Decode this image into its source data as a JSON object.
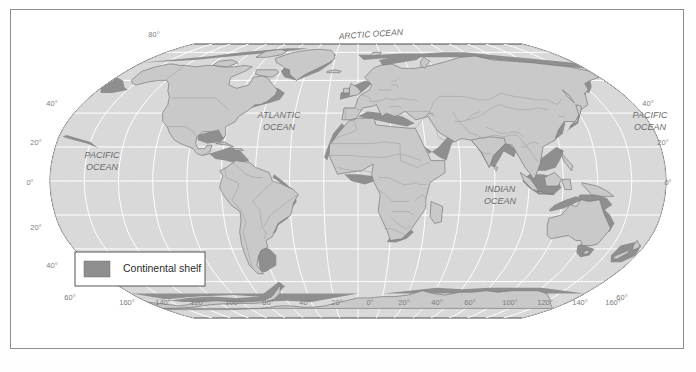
{
  "figure": {
    "type": "map",
    "projection": "Robinson",
    "background_color": "#ffffff",
    "frame_color": "#8d8d8d"
  },
  "colors": {
    "ocean": "#d9d9d9",
    "land": "#c9c9c9",
    "shelf": "#8f8f8f",
    "graticule": "#ffffff",
    "coast_outline": "#7a7a7a",
    "country_border": "#9a9a9a",
    "map_edge": "#4a4a4a",
    "label_text": "#6b6b6b",
    "legend_text": "#2b2b2b",
    "legend_border": "#555555",
    "legend_fill": "#ffffff"
  },
  "ocean_labels": [
    {
      "id": "arctic-ocean",
      "text": "ARCTIC  OCEAN",
      "x": 371,
      "y": 37,
      "size": 8.5,
      "rotate": -4
    },
    {
      "id": "atlantic-ocean-line1",
      "text": "ATLANTIC",
      "x": 279,
      "y": 118,
      "size": 9
    },
    {
      "id": "atlantic-ocean-line2",
      "text": "OCEAN",
      "x": 279,
      "y": 130,
      "size": 9
    },
    {
      "id": "pacific-ocean-west-line1",
      "text": "PACIFIC",
      "x": 102,
      "y": 158,
      "size": 9
    },
    {
      "id": "pacific-ocean-west-line2",
      "text": "OCEAN",
      "x": 102,
      "y": 170,
      "size": 9
    },
    {
      "id": "pacific-ocean-east-line1",
      "text": "PACIFIC",
      "x": 650,
      "y": 118,
      "size": 9
    },
    {
      "id": "pacific-ocean-east-line2",
      "text": "OCEAN",
      "x": 650,
      "y": 130,
      "size": 9
    },
    {
      "id": "indian-ocean-line1",
      "text": "INDIAN",
      "x": 500,
      "y": 192,
      "size": 9
    },
    {
      "id": "indian-ocean-line2",
      "text": "OCEAN",
      "x": 500,
      "y": 204,
      "size": 9
    }
  ],
  "latitude_labels_left": [
    {
      "text": "80°",
      "x": 154,
      "y": 37
    },
    {
      "text": "40°",
      "x": 52,
      "y": 106
    },
    {
      "text": "20°",
      "x": 36,
      "y": 145
    },
    {
      "text": "0°",
      "x": 30,
      "y": 185
    },
    {
      "text": "20°",
      "x": 36,
      "y": 230
    },
    {
      "text": "40°",
      "x": 52,
      "y": 268
    },
    {
      "text": "60°",
      "x": 70,
      "y": 300
    }
  ],
  "latitude_labels_right": [
    {
      "text": "40°",
      "x": 648,
      "y": 106
    },
    {
      "text": "20°",
      "x": 663,
      "y": 145
    },
    {
      "text": "0°",
      "x": 668,
      "y": 185
    },
    {
      "text": "60°",
      "x": 622,
      "y": 300
    }
  ],
  "longitude_labels": [
    {
      "text": "160°",
      "x": 127,
      "y": 305
    },
    {
      "text": "140°",
      "x": 163,
      "y": 305
    },
    {
      "text": "120°",
      "x": 198,
      "y": 305
    },
    {
      "text": "100°",
      "x": 233,
      "y": 305
    },
    {
      "text": "80°",
      "x": 268,
      "y": 305
    },
    {
      "text": "40°",
      "x": 305,
      "y": 305
    },
    {
      "text": "20°",
      "x": 337,
      "y": 305
    },
    {
      "text": "0°",
      "x": 370,
      "y": 305
    },
    {
      "text": "20°",
      "x": 404,
      "y": 305
    },
    {
      "text": "40°",
      "x": 437,
      "y": 305
    },
    {
      "text": "60°",
      "x": 470,
      "y": 305
    },
    {
      "text": "100°",
      "x": 510,
      "y": 305
    },
    {
      "text": "120°",
      "x": 545,
      "y": 305
    },
    {
      "text": "140°",
      "x": 580,
      "y": 305
    },
    {
      "text": "160°",
      "x": 613,
      "y": 305
    }
  ],
  "legend": {
    "label": "Continental shelf",
    "swatch_color": "#8f8f8f",
    "box": {
      "x": 75,
      "y": 252,
      "width": 130,
      "height": 34
    }
  },
  "graticule": {
    "latitudes": [
      80,
      60,
      40,
      20,
      0,
      -20,
      -40,
      -60
    ],
    "longitude_step_deg": 20,
    "visible": true
  }
}
